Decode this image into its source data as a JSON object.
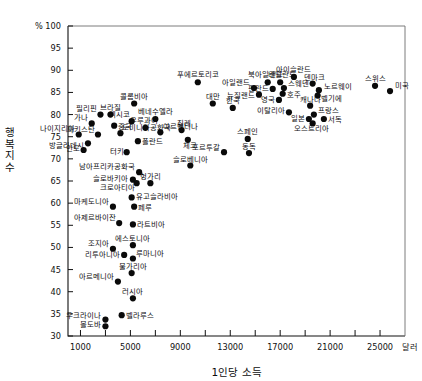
{
  "chart_data": {
    "type": "scatter",
    "title": "",
    "xlabel": "1인당 소득",
    "ylabel": "행복지수",
    "x_unit": "달러",
    "y_unit": "%",
    "xlim": [
      0,
      27000
    ],
    "ylim": [
      30,
      100
    ],
    "grid": false,
    "legend": "none",
    "xticks": [
      1000,
      5000,
      9000,
      13000,
      17000,
      21000,
      25000
    ],
    "xtick_labels": [
      "1000",
      "5000",
      "9000",
      "13000",
      "17000",
      "21000",
      "25000"
    ],
    "xminorticks": [
      3000,
      7000,
      11000,
      15000,
      19000,
      23000
    ],
    "yticks": [
      30,
      35,
      40,
      45,
      50,
      55,
      60,
      65,
      70,
      75,
      80,
      85,
      90,
      95,
      100
    ],
    "ytick_labels": [
      "30",
      "35",
      "40",
      "45",
      "50",
      "55",
      "60",
      "65",
      "70",
      "75",
      "80",
      "85",
      "90",
      "95",
      "100"
    ],
    "y_top_unit_label": "% 100",
    "points": [
      {
        "label": "나이지리아",
        "x": 860,
        "y": 75.5,
        "lx": -4,
        "ly": -4,
        "anchor": "end"
      },
      {
        "label": "인도",
        "x": 1250,
        "y": 72.0,
        "lx": -4,
        "ly": 1,
        "anchor": "end"
      },
      {
        "label": "방글라데시",
        "x": 1600,
        "y": 73.5,
        "lx": -4,
        "ly": 5,
        "anchor": "end"
      },
      {
        "label": "가나",
        "x": 1900,
        "y": 78.0,
        "lx": -4,
        "ly": -3,
        "anchor": "end"
      },
      {
        "label": "파키스탄",
        "x": 2400,
        "y": 75.5,
        "lx": -3,
        "ly": -3,
        "anchor": "end"
      },
      {
        "label": "필리핀",
        "x": 2600,
        "y": 80.0,
        "lx": -3,
        "ly": -4,
        "anchor": "end"
      },
      {
        "label": "브라질",
        "x": 3400,
        "y": 80.0,
        "lx": 0,
        "ly": -5,
        "anchor": "mid"
      },
      {
        "label": "중국",
        "x": 3700,
        "y": 77.5,
        "lx": 4,
        "ly": 3,
        "anchor": "start"
      },
      {
        "label": "도미니카공화국",
        "x": 4200,
        "y": 75.8,
        "lx": 2,
        "ly": -3,
        "anchor": "start"
      },
      {
        "label": "터키",
        "x": 4700,
        "y": 71.5,
        "lx": -3,
        "ly": 2,
        "anchor": "end"
      },
      {
        "label": "멕시코",
        "x": 5100,
        "y": 78.5,
        "lx": -2,
        "ly": -4,
        "anchor": "end"
      },
      {
        "label": "콜롬비아",
        "x": 5300,
        "y": 82.5,
        "lx": 0,
        "ly": -5,
        "anchor": "mid"
      },
      {
        "label": "폴란드",
        "x": 5600,
        "y": 74.0,
        "lx": 4,
        "ly": 3,
        "anchor": "start"
      },
      {
        "label": "남아프리카공화국",
        "x": 5700,
        "y": 67.0,
        "lx": -4,
        "ly": -3,
        "anchor": "end"
      },
      {
        "label": "우루과이",
        "x": 6200,
        "y": 77.0,
        "lx": -1,
        "ly": -5,
        "anchor": "mid"
      },
      {
        "label": "베네수엘라",
        "x": 7000,
        "y": 79.0,
        "lx": 0,
        "ly": -5,
        "anchor": "mid"
      },
      {
        "label": "아르헨티나",
        "x": 7400,
        "y": 76.0,
        "lx": 3,
        "ly": -3,
        "anchor": "start"
      },
      {
        "label": "슬로바키아",
        "x": 5200,
        "y": 65.3,
        "lx": -5,
        "ly": 1,
        "anchor": "end"
      },
      {
        "label": "크로아티아",
        "x": 5500,
        "y": 64.5,
        "lx": -2,
        "ly": 7,
        "anchor": "end"
      },
      {
        "label": "헝가리",
        "x": 6600,
        "y": 64.5,
        "lx": 0,
        "ly": -4,
        "anchor": "mid"
      },
      {
        "label": "마케도니아",
        "x": 3600,
        "y": 59.2,
        "lx": -4,
        "ly": -3,
        "anchor": "end"
      },
      {
        "label": "유고슬라비아",
        "x": 5100,
        "y": 61.3,
        "lx": 4,
        "ly": 2,
        "anchor": "start"
      },
      {
        "label": "페루",
        "x": 5300,
        "y": 59.2,
        "lx": 4,
        "ly": 3,
        "anchor": "start"
      },
      {
        "label": "아제르바이잔",
        "x": 4100,
        "y": 55.5,
        "lx": -3,
        "ly": -3,
        "anchor": "end"
      },
      {
        "label": "라트비아",
        "x": 5200,
        "y": 55.2,
        "lx": 4,
        "ly": 3,
        "anchor": "start"
      },
      {
        "label": "에스토니아",
        "x": 5200,
        "y": 50.5,
        "lx": 0,
        "ly": -4,
        "anchor": "mid"
      },
      {
        "label": "조지아",
        "x": 3600,
        "y": 49.7,
        "lx": -4,
        "ly": -3,
        "anchor": "end"
      },
      {
        "label": "리투아니아",
        "x": 4500,
        "y": 48.3,
        "lx": -4,
        "ly": 2,
        "anchor": "end"
      },
      {
        "label": "루마니아",
        "x": 5200,
        "y": 47.5,
        "lx": 3,
        "ly": -3,
        "anchor": "start"
      },
      {
        "label": "불가리아",
        "x": 5100,
        "y": 44.2,
        "lx": 1,
        "ly": -4,
        "anchor": "mid"
      },
      {
        "label": "아르메니아",
        "x": 4000,
        "y": 42.3,
        "lx": -4,
        "ly": -3,
        "anchor": "end"
      },
      {
        "label": "러시아",
        "x": 5200,
        "y": 38.5,
        "lx": 0,
        "ly": -4,
        "anchor": "mid"
      },
      {
        "label": "우크라이나",
        "x": 3000,
        "y": 33.7,
        "lx": -4,
        "ly": -2,
        "anchor": "end"
      },
      {
        "label": "벨라루스",
        "x": 4300,
        "y": 34.7,
        "lx": 4,
        "ly": 3,
        "anchor": "start"
      },
      {
        "label": "몰도바",
        "x": 3000,
        "y": 32.2,
        "lx": -4,
        "ly": 1,
        "anchor": "end"
      },
      {
        "label": "슬로베니아",
        "x": 9800,
        "y": 68.5,
        "lx": 0,
        "ly": -4,
        "anchor": "mid"
      },
      {
        "label": "칠레",
        "x": 9100,
        "y": 76.5,
        "lx": 2,
        "ly": -4,
        "anchor": "mid"
      },
      {
        "label": "체코",
        "x": 9600,
        "y": 74.3,
        "lx": 2,
        "ly": 8,
        "anchor": "mid"
      },
      {
        "label": "푸에르토리코",
        "x": 10400,
        "y": 87.3,
        "lx": 0,
        "ly": -5,
        "anchor": "mid"
      },
      {
        "label": "대만",
        "x": 11600,
        "y": 82.5,
        "lx": 0,
        "ly": -5,
        "anchor": "mid"
      },
      {
        "label": "한국",
        "x": 13200,
        "y": 81.5,
        "lx": 0,
        "ly": -5,
        "anchor": "mid"
      },
      {
        "label": "포르투갈",
        "x": 12500,
        "y": 71.5,
        "lx": -4,
        "ly": -2,
        "anchor": "end"
      },
      {
        "label": "스페인",
        "x": 14400,
        "y": 74.5,
        "lx": 0,
        "ly": -5,
        "anchor": "mid"
      },
      {
        "label": "동독",
        "x": 14500,
        "y": 71.3,
        "lx": 0,
        "ly": -4,
        "anchor": "mid"
      },
      {
        "label": "아일랜드",
        "x": 14900,
        "y": 86.0,
        "lx": -4,
        "ly": -3,
        "anchor": "end"
      },
      {
        "label": "뉴질랜드",
        "x": 15300,
        "y": 84.5,
        "lx": -4,
        "ly": 3,
        "anchor": "end"
      },
      {
        "label": "북아일랜드",
        "x": 16000,
        "y": 87.3,
        "lx": -2,
        "ly": -5,
        "anchor": "mid"
      },
      {
        "label": "핀란드",
        "x": 16400,
        "y": 85.8,
        "lx": -4,
        "ly": 2,
        "anchor": "end"
      },
      {
        "label": "네덜란드",
        "x": 17000,
        "y": 87.3,
        "lx": 2,
        "ly": -5,
        "anchor": "mid"
      },
      {
        "label": "스웨덴",
        "x": 17300,
        "y": 86.0,
        "lx": 4,
        "ly": -2,
        "anchor": "start"
      },
      {
        "label": "호주",
        "x": 17200,
        "y": 84.7,
        "lx": 4,
        "ly": 3,
        "anchor": "start"
      },
      {
        "label": "영국",
        "x": 16900,
        "y": 83.3,
        "lx": -4,
        "ly": 2,
        "anchor": "end"
      },
      {
        "label": "아이슬란드",
        "x": 18100,
        "y": 88.5,
        "lx": 0,
        "ly": -5,
        "anchor": "mid"
      },
      {
        "label": "이탈리아",
        "x": 17700,
        "y": 80.5,
        "lx": -4,
        "ly": 1,
        "anchor": "end"
      },
      {
        "label": "덴마크",
        "x": 19600,
        "y": 87.0,
        "lx": 2,
        "ly": -4,
        "anchor": "mid"
      },
      {
        "label": "노르웨이",
        "x": 20100,
        "y": 85.5,
        "lx": 5,
        "ly": -1,
        "anchor": "start"
      },
      {
        "label": "벨기에",
        "x": 20000,
        "y": 84.3,
        "lx": 3,
        "ly": 5,
        "anchor": "start"
      },
      {
        "label": "캐나다",
        "x": 19400,
        "y": 82.0,
        "lx": 0,
        "ly": -4,
        "anchor": "mid"
      },
      {
        "label": "프랑스",
        "x": 19700,
        "y": 80.0,
        "lx": 4,
        "ly": -2,
        "anchor": "start"
      },
      {
        "label": "일본",
        "x": 19300,
        "y": 79.0,
        "lx": -4,
        "ly": 2,
        "anchor": "end"
      },
      {
        "label": "서독",
        "x": 20500,
        "y": 79.0,
        "lx": 4,
        "ly": 3,
        "anchor": "start"
      },
      {
        "label": "오스트리아",
        "x": 19600,
        "y": 78.0,
        "lx": -1,
        "ly": 8,
        "anchor": "mid"
      },
      {
        "label": "스위스",
        "x": 24600,
        "y": 86.5,
        "lx": 0,
        "ly": -5,
        "anchor": "mid"
      },
      {
        "label": "미국",
        "x": 25800,
        "y": 85.3,
        "lx": 5,
        "ly": -3,
        "anchor": "start"
      }
    ]
  }
}
